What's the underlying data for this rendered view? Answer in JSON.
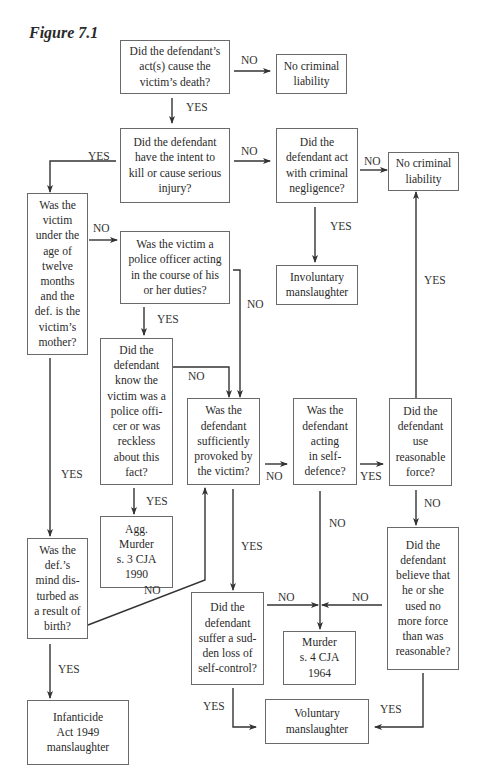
{
  "figure": {
    "title": "Figure 7.1"
  },
  "nodes": {
    "cause_death": "Did the defendant’s\nact(s) cause the\nvictim’s death?",
    "no_liability_1": "No criminal\nliability",
    "intent": "Did the defendant\nhave the intent to\nkill or cause serious\ninjury?",
    "negligence": "Did the\ndefendant act\nwith criminal\nnegligence?",
    "no_liability_2": "No criminal\nliability",
    "under_twelve": "Was the\nvictim\nunder the\nage of\ntwelve\nmonths\nand the\ndef. is the\nvictim’s\nmother?",
    "police_officer": "Was the victim a\npolice officer acting\nin the course of his\nor her duties?",
    "involuntary": "Involuntary\nmanslaughter",
    "knew_police": "Did the\ndefendant\nknow the\nvictim was a\npolice offi-\ncer or was\nreckless\nabout this\nfact?",
    "provoked": "Was the\ndefendant\nsufficiently\nprovoked by\nthe victim?",
    "self_defence": "Was the\ndefendant\nacting\nin self-\ndefence?",
    "reasonable_force": "Did the\ndefendant\nuse\nreasonable\nforce?",
    "agg_murder": "Agg.\nMurder\ns. 3 CJA\n1990",
    "mind_disturbed": "Was the\ndef.’s\nmind dis-\nturbed as\na result of\nbirth?",
    "believe_no_more_force": "Did the\ndefendant\nbelieve that\nhe or she\nused no\nmore force\nthan was\nreasonable?",
    "loss_self_control": "Did the\ndefendant\nsuffer a sud-\nden loss of\nself-control?",
    "murder": "Murder\ns. 4 CJA\n1964",
    "infanticide": "Infanticide\nAct 1949\nmanslaughter",
    "voluntary": "Voluntary\nmanslaughter"
  },
  "labels": {
    "cause_no": "NO",
    "cause_yes": "YES",
    "intent_no": "NO",
    "intent_yes": "YES",
    "negligence_no": "NO",
    "negligence_yes": "YES",
    "force_yes": "YES",
    "under12_no": "NO",
    "under12_yes": "YES",
    "police_yes": "YES",
    "police_no": "NO",
    "knew_no": "NO",
    "knew_yes": "YES",
    "provoked_no": "NO",
    "provoked_yes": "YES",
    "selfdef_yes": "YES",
    "selfdef_no": "NO",
    "force_no": "NO",
    "mind_no": "NO",
    "mind_yes": "YES",
    "control_no": "NO",
    "believe_no": "NO",
    "control_yes": "YES",
    "believe_yes": "YES"
  }
}
